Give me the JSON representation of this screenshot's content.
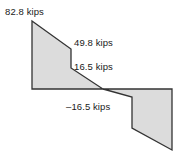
{
  "figure": {
    "name": "shear-force-diagram",
    "background_color": "#ffffff",
    "fill_color": "#dcdcdc",
    "stroke_color": "#333333",
    "text_color": "#1a1a1a"
  },
  "labels": {
    "max": "82.8 kips",
    "mid": "49.8 kips",
    "positive": "16.5 kips",
    "negative": "–16.5 kips"
  },
  "chart_data": {
    "type": "area",
    "title": "",
    "xlabel": "",
    "ylabel": "",
    "units": "kips",
    "grid": false,
    "legend": false,
    "annotations": [
      {
        "text": "82.8 kips",
        "value": 82.8,
        "position": "top-left"
      },
      {
        "text": "49.8 kips",
        "value": 49.8,
        "position": "mid-right-upper"
      },
      {
        "text": "16.5 kips",
        "value": 16.5,
        "position": "mid-right-lower"
      },
      {
        "text": "–16.5 kips",
        "value": -16.5,
        "position": "below-baseline"
      }
    ],
    "series": [
      {
        "name": "shear",
        "points": [
          {
            "x": 0.0,
            "y": 82.8
          },
          {
            "x": 0.29,
            "y": 49.8
          },
          {
            "x": 0.29,
            "y": 16.5
          },
          {
            "x": 0.52,
            "y": 0.0
          },
          {
            "x": 0.72,
            "y": -16.5
          },
          {
            "x": 0.72,
            "y": -47.0
          },
          {
            "x": 1.0,
            "y": -62.0
          }
        ]
      }
    ],
    "ylim": [
      -62,
      82.8
    ],
    "zero_line": true
  },
  "shapes": {
    "positive_polygon": "32,21 71,49 71,68 103,89 32,89",
    "negative_polygon": "103,89 132,97 132,128 172,150 172,89",
    "zero_line": "32,89 172,89"
  }
}
